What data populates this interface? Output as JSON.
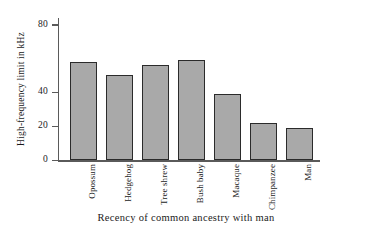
{
  "chart_data": {
    "type": "bar",
    "title": "",
    "xlabel": "Recency of common ancestry with man",
    "ylabel": "High-frequency limit in kHz",
    "categories": [
      "Opossum",
      "Hedgehog",
      "Tree shrew",
      "Bush baby",
      "Macaque",
      "Chimpanzee",
      "Man"
    ],
    "values": [
      58,
      50,
      56,
      59,
      39,
      22,
      19
    ],
    "ylim": [
      0,
      84
    ],
    "yticks": [
      0,
      20,
      40,
      80
    ],
    "ytick_labels": [
      "0",
      "20",
      "40",
      "80"
    ],
    "grid": false,
    "legend": null,
    "bar_fill_color": "#a9a9a9",
    "bar_edge_color": "#2b2b2b",
    "axis_color": "#5a5a5a",
    "background_color": "#ffffff"
  }
}
